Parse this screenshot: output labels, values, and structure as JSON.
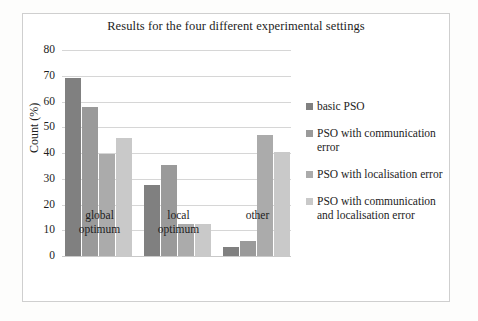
{
  "figure": {
    "background_color": "#ffffff",
    "border_color": "#cfcfcf"
  },
  "chart_data": {
    "type": "bar",
    "title": "Results for the four different experimental settings",
    "xlabel": "",
    "ylabel": "Count (%)",
    "ylim": [
      0,
      80
    ],
    "ytick_step": 10,
    "yticks": [
      "80",
      "70",
      "60",
      "50",
      "40",
      "30",
      "20",
      "10",
      "0"
    ],
    "grid": true,
    "grid_axis": "y",
    "legend_position": "right",
    "categories": [
      "global\noptimum",
      "local\noptimum",
      "other"
    ],
    "category_labels_flat": [
      "global optimum",
      "local optimum",
      "other"
    ],
    "series": [
      {
        "name": "basic PSO",
        "color": "#808080",
        "values": [
          69,
          27.5,
          3.5
        ]
      },
      {
        "name": "PSO with communication error",
        "color": "#9a9a9a",
        "values": [
          58,
          35.5,
          6
        ]
      },
      {
        "name": "PSO with localisation error",
        "color": "#ababab",
        "values": [
          39.5,
          12.5,
          47
        ]
      },
      {
        "name": "PSO with communication and localisation error",
        "color": "#c9c9c9",
        "values": [
          46,
          12.5,
          40.5
        ]
      }
    ]
  }
}
